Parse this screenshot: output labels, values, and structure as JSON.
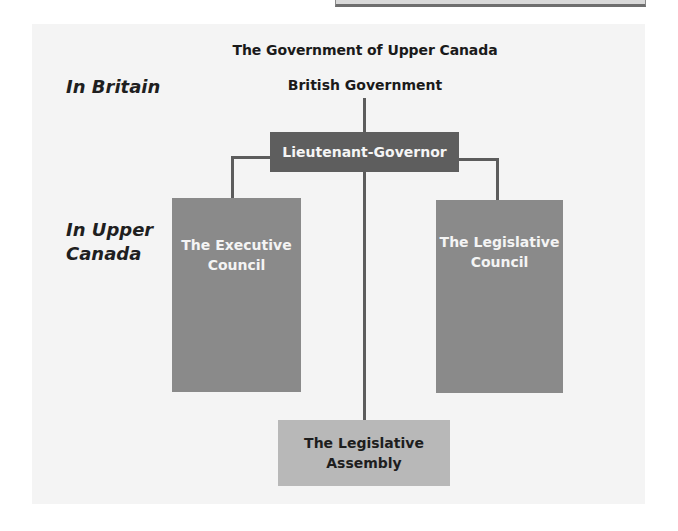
{
  "diagram": {
    "title": "The Government of Upper Canada",
    "regions": {
      "britain": "In Britain",
      "upper_canada_line1": "In Upper",
      "upper_canada_line2": "Canada"
    },
    "nodes": {
      "british_government": "British Government",
      "lieutenant_governor": "Lieutenant-Governor",
      "executive_council_line1": "The Executive",
      "executive_council_line2": "Council",
      "legislative_council_line1": "The Legislative",
      "legislative_council_line2": "Council",
      "legislative_assembly_line1": "The Legislative",
      "legislative_assembly_line2": "Assembly"
    },
    "connections": [
      {
        "from": "British Government",
        "to": "Lieutenant-Governor"
      },
      {
        "from": "Lieutenant-Governor",
        "to": "The Executive Council"
      },
      {
        "from": "Lieutenant-Governor",
        "to": "The Legislative Council"
      },
      {
        "from": "Lieutenant-Governor",
        "to": "The Legislative Assembly"
      }
    ],
    "colors": {
      "panel": "#f4f4f4",
      "lieutenant_governor_box": "#5e5e5e",
      "council_boxes": "#8a8a8a",
      "assembly_box": "#b8b8b8",
      "connector": "#5c5c5c"
    }
  }
}
